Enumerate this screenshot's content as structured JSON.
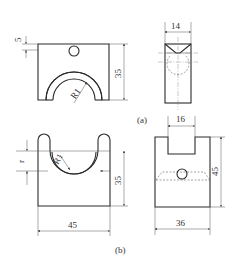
{
  "figure": {
    "part_a": {
      "label": "(a)",
      "front_view": {
        "dim_hole_offset": "5",
        "dim_height": "35",
        "radius_label": "R1"
      },
      "side_view": {
        "dim_width": "14"
      }
    },
    "part_b": {
      "label": "(b)",
      "front_view": {
        "dim_depth": "r",
        "radius_label": "R1",
        "dim_height": "35",
        "dim_width": "45"
      },
      "side_view": {
        "dim_slot_width": "16",
        "dim_height": "45",
        "dim_width": "36"
      }
    }
  }
}
